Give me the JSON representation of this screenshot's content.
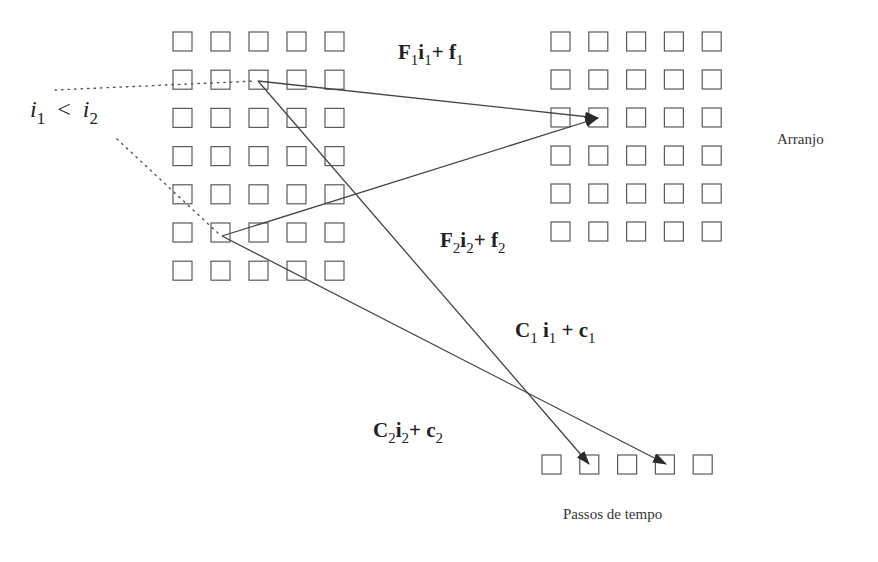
{
  "diagram": {
    "left_grid": {
      "cols": 5,
      "rows": 7,
      "x0": 173,
      "y0": 32,
      "step_x": 38,
      "step_y": 38.2,
      "size": 19
    },
    "right_grid": {
      "cols": 5,
      "rows": 6,
      "x0": 551,
      "y0": 32,
      "step_x": 37.8,
      "step_y": 38,
      "size": 19,
      "label": "Arranjo"
    },
    "time_steps": {
      "count": 5,
      "x0": 542,
      "y0": 455,
      "step_x": 37.8,
      "size": 19,
      "label": "Passos de tempo"
    },
    "inequality": {
      "left_var": "i",
      "left_sub": "1",
      "operator": "<",
      "right_var": "i",
      "right_sub": "2"
    },
    "formulas": {
      "f1": {
        "A": "F",
        "A_sub": "1",
        "i": "i",
        "i_sub": "1",
        "plus": "+",
        "b": "f",
        "b_sub": "1"
      },
      "f2": {
        "A": "F",
        "A_sub": "2",
        "i": "i",
        "i_sub": "2",
        "plus": "+",
        "b": "f",
        "b_sub": "2"
      },
      "c1": {
        "A": "C",
        "A_sub": "1",
        "i": "i",
        "i_sub": "1",
        "plus": "+",
        "b": "c",
        "b_sub": "1"
      },
      "c2": {
        "A": "C",
        "A_sub": "2",
        "i": "i",
        "i_sub": "2",
        "plus": "+",
        "b": "c",
        "b_sub": "2"
      }
    },
    "colors": {
      "stroke": "#5a5a5a",
      "arrow": "#444444",
      "text": "#222222"
    }
  }
}
